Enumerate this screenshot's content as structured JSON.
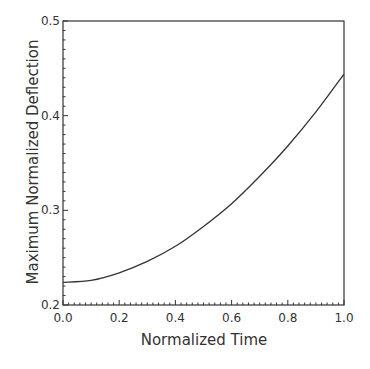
{
  "chart_data": {
    "type": "line",
    "title": "",
    "xlabel": "Normalized Time",
    "ylabel": "Maximum Normalized Deflection",
    "xlim": [
      0.0,
      1.0
    ],
    "ylim": [
      0.2,
      0.5
    ],
    "xticks": [
      "0.0",
      "0.2",
      "0.4",
      "0.6",
      "0.8",
      "1.0"
    ],
    "yticks": [
      "0.2",
      "0.3",
      "0.4",
      "0.5"
    ],
    "grid": false,
    "legend": null,
    "series": [
      {
        "name": "Maximum Normalized Deflection",
        "x": [
          0.0,
          0.1,
          0.2,
          0.3,
          0.4,
          0.5,
          0.6,
          0.7,
          0.8,
          0.9,
          1.0
        ],
        "values": [
          0.224,
          0.226,
          0.234,
          0.246,
          0.262,
          0.283,
          0.307,
          0.336,
          0.368,
          0.404,
          0.444
        ]
      }
    ]
  },
  "colors": {
    "line": "#333333",
    "axis": "#333333",
    "background": "#ffffff"
  }
}
